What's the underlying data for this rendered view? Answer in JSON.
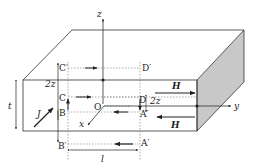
{
  "diagram": {
    "type": "physics-slab-cross-section",
    "colors": {
      "line": "#333333",
      "dashed": "#777777",
      "side_face": "#c8c8c8",
      "background": "#ffffff"
    },
    "axes": {
      "z": "z",
      "y": "y",
      "x": "x",
      "origin": "O"
    },
    "points": {
      "C_prime": "C′",
      "D_prime": "D′",
      "C": "C",
      "D": "D",
      "B": "B",
      "A": "A′",
      "B_prime": "B′",
      "A_prime": "A′"
    },
    "dimensions": {
      "thickness": "t",
      "length": "l",
      "half_height_left": "2z",
      "half_height_right": "2z"
    },
    "fields": {
      "current_density": "J",
      "field_top": "H",
      "field_bottom": "H"
    }
  }
}
